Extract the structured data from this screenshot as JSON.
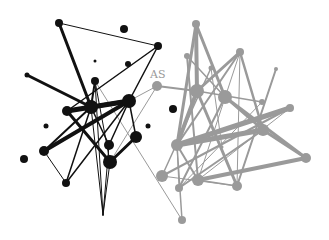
{
  "diagram": {
    "type": "network-graph",
    "width": 329,
    "height": 240,
    "colors": {
      "cluster_a": "#111111",
      "cluster_b": "#9a9a9a",
      "background": "#ffffff"
    },
    "labels": [
      {
        "text": "AS",
        "x": 150,
        "y": 78
      }
    ],
    "nodes": [
      {
        "id": "a1",
        "cluster": "a",
        "x": 59,
        "y": 23,
        "r": 4
      },
      {
        "id": "a2",
        "cluster": "a",
        "x": 124,
        "y": 29,
        "r": 4
      },
      {
        "id": "a3",
        "cluster": "a",
        "x": 158,
        "y": 46,
        "r": 4
      },
      {
        "id": "a4",
        "cluster": "a",
        "x": 95,
        "y": 61,
        "r": 1.5
      },
      {
        "id": "a5",
        "cluster": "a",
        "x": 128,
        "y": 64,
        "r": 3
      },
      {
        "id": "a6",
        "cluster": "a",
        "x": 27,
        "y": 75,
        "r": 2.5
      },
      {
        "id": "a7",
        "cluster": "a",
        "x": 95,
        "y": 81,
        "r": 4
      },
      {
        "id": "a8",
        "cluster": "a",
        "x": 91,
        "y": 107,
        "r": 7
      },
      {
        "id": "a9",
        "cluster": "a",
        "x": 129,
        "y": 101,
        "r": 7
      },
      {
        "id": "a10",
        "cluster": "a",
        "x": 67,
        "y": 111,
        "r": 5
      },
      {
        "id": "a11",
        "cluster": "a",
        "x": 46,
        "y": 126,
        "r": 2.5
      },
      {
        "id": "a12",
        "cluster": "a",
        "x": 109,
        "y": 145,
        "r": 5
      },
      {
        "id": "a13",
        "cluster": "a",
        "x": 44,
        "y": 151,
        "r": 5
      },
      {
        "id": "a14",
        "cluster": "a",
        "x": 136,
        "y": 137,
        "r": 6
      },
      {
        "id": "a15",
        "cluster": "a",
        "x": 148,
        "y": 126,
        "r": 2.5
      },
      {
        "id": "a16",
        "cluster": "a",
        "x": 24,
        "y": 159,
        "r": 4
      },
      {
        "id": "a17",
        "cluster": "a",
        "x": 110,
        "y": 162,
        "r": 7
      },
      {
        "id": "a18",
        "cluster": "a",
        "x": 66,
        "y": 183,
        "r": 4
      },
      {
        "id": "a19",
        "cluster": "a",
        "x": 173,
        "y": 109,
        "r": 4
      },
      {
        "id": "a20",
        "cluster": "a",
        "x": 103,
        "y": 215,
        "r": 0.5
      },
      {
        "id": "b1",
        "cluster": "b",
        "x": 157,
        "y": 86,
        "r": 5
      },
      {
        "id": "b2",
        "cluster": "b",
        "x": 196,
        "y": 24,
        "r": 4
      },
      {
        "id": "b3",
        "cluster": "b",
        "x": 187,
        "y": 56,
        "r": 3
      },
      {
        "id": "b4",
        "cluster": "b",
        "x": 211,
        "y": 68,
        "r": 2.5
      },
      {
        "id": "b5",
        "cluster": "b",
        "x": 240,
        "y": 52,
        "r": 4
      },
      {
        "id": "b6",
        "cluster": "b",
        "x": 276,
        "y": 69,
        "r": 2
      },
      {
        "id": "b7",
        "cluster": "b",
        "x": 197,
        "y": 91,
        "r": 7
      },
      {
        "id": "b8",
        "cluster": "b",
        "x": 225,
        "y": 97,
        "r": 7
      },
      {
        "id": "b9",
        "cluster": "b",
        "x": 262,
        "y": 102,
        "r": 3
      },
      {
        "id": "b10",
        "cluster": "b",
        "x": 290,
        "y": 108,
        "r": 4
      },
      {
        "id": "b11",
        "cluster": "b",
        "x": 177,
        "y": 145,
        "r": 6
      },
      {
        "id": "b12",
        "cluster": "b",
        "x": 263,
        "y": 130,
        "r": 6
      },
      {
        "id": "b13",
        "cluster": "b",
        "x": 306,
        "y": 158,
        "r": 5
      },
      {
        "id": "b14",
        "cluster": "b",
        "x": 162,
        "y": 176,
        "r": 6
      },
      {
        "id": "b15",
        "cluster": "b",
        "x": 198,
        "y": 180,
        "r": 6
      },
      {
        "id": "b16",
        "cluster": "b",
        "x": 237,
        "y": 186,
        "r": 5
      },
      {
        "id": "b17",
        "cluster": "b",
        "x": 179,
        "y": 188,
        "r": 4
      },
      {
        "id": "b18",
        "cluster": "b",
        "x": 182,
        "y": 220,
        "r": 4
      },
      {
        "id": "b19",
        "cluster": "b",
        "x": 222,
        "y": 147,
        "r": 1.5
      }
    ],
    "edges": [
      {
        "from": "a1",
        "to": "a3",
        "w": 1
      },
      {
        "from": "a1",
        "to": "a8",
        "w": 3
      },
      {
        "from": "a3",
        "to": "a10",
        "w": 1.5
      },
      {
        "from": "a3",
        "to": "a9",
        "w": 1.5
      },
      {
        "from": "a6",
        "to": "a8",
        "w": 3
      },
      {
        "from": "a7",
        "to": "a8",
        "w": 2
      },
      {
        "from": "a7",
        "to": "a17",
        "w": 1
      },
      {
        "from": "a10",
        "to": "a9",
        "w": 5
      },
      {
        "from": "a8",
        "to": "a9",
        "w": 4
      },
      {
        "from": "a9",
        "to": "a13",
        "w": 4
      },
      {
        "from": "a10",
        "to": "a17",
        "w": 3
      },
      {
        "from": "a13",
        "to": "a18",
        "w": 1
      },
      {
        "from": "a13",
        "to": "a8",
        "w": 2
      },
      {
        "from": "a18",
        "to": "a8",
        "w": 1.5
      },
      {
        "from": "a18",
        "to": "a9",
        "w": 1.5
      },
      {
        "from": "a17",
        "to": "a14",
        "w": 3
      },
      {
        "from": "a9",
        "to": "a14",
        "w": 1.5
      },
      {
        "from": "a8",
        "to": "a12",
        "w": 1.5
      },
      {
        "from": "a12",
        "to": "a9",
        "w": 1.5
      },
      {
        "from": "a8",
        "to": "a20",
        "w": 1
      },
      {
        "from": "a7",
        "to": "a20",
        "w": 1
      },
      {
        "from": "a17",
        "to": "a20",
        "w": 1
      },
      {
        "from": "a12",
        "to": "a20",
        "w": 1
      },
      {
        "from": "a9",
        "to": "b1",
        "w": 1,
        "color": "b"
      },
      {
        "from": "a17",
        "to": "b1",
        "w": 1,
        "color": "b"
      },
      {
        "from": "a7",
        "to": "b18",
        "w": 1,
        "color": "b"
      },
      {
        "from": "b1",
        "to": "b7",
        "w": 2
      },
      {
        "from": "b2",
        "to": "b7",
        "w": 4
      },
      {
        "from": "b2",
        "to": "b8",
        "w": 3
      },
      {
        "from": "b2",
        "to": "b11",
        "w": 3
      },
      {
        "from": "b3",
        "to": "b8",
        "w": 1.5
      },
      {
        "from": "b3",
        "to": "b15",
        "w": 2
      },
      {
        "from": "b4",
        "to": "b14",
        "w": 1.5
      },
      {
        "from": "b5",
        "to": "b7",
        "w": 3
      },
      {
        "from": "b5",
        "to": "b11",
        "w": 2
      },
      {
        "from": "b5",
        "to": "b16",
        "w": 1
      },
      {
        "from": "b5",
        "to": "b12",
        "w": 2.5
      },
      {
        "from": "b5",
        "to": "b15",
        "w": 1
      },
      {
        "from": "b6",
        "to": "b16",
        "w": 2
      },
      {
        "from": "b7",
        "to": "b9",
        "w": 1.5
      },
      {
        "from": "b7",
        "to": "b11",
        "w": 4
      },
      {
        "from": "b7",
        "to": "b16",
        "w": 3
      },
      {
        "from": "b8",
        "to": "b12",
        "w": 2.5
      },
      {
        "from": "b8",
        "to": "b13",
        "w": 3
      },
      {
        "from": "b8",
        "to": "b17",
        "w": 2
      },
      {
        "from": "b10",
        "to": "b11",
        "w": 5
      },
      {
        "from": "b10",
        "to": "b14",
        "w": 2
      },
      {
        "from": "b10",
        "to": "b15",
        "w": 1
      },
      {
        "from": "b11",
        "to": "b12",
        "w": 5
      },
      {
        "from": "b11",
        "to": "b15",
        "w": 2
      },
      {
        "from": "b11",
        "to": "b18",
        "w": 1.5
      },
      {
        "from": "b12",
        "to": "b13",
        "w": 3
      },
      {
        "from": "b12",
        "to": "b17",
        "w": 2
      },
      {
        "from": "b13",
        "to": "b15",
        "w": 4
      },
      {
        "from": "b14",
        "to": "b16",
        "w": 1
      },
      {
        "from": "b15",
        "to": "b16",
        "w": 1.5
      },
      {
        "from": "b9",
        "to": "b17",
        "w": 1
      },
      {
        "from": "b4",
        "to": "b19",
        "w": 1
      },
      {
        "from": "b11",
        "to": "b17",
        "w": 1
      }
    ]
  }
}
